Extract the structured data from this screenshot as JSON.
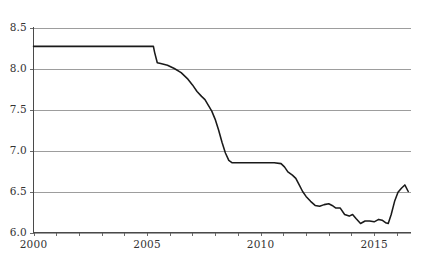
{
  "chart_data": {
    "type": "line",
    "title": "",
    "subtitle": "",
    "xlabel": "",
    "ylabel": "",
    "xlim": [
      2000,
      2016.6
    ],
    "ylim": [
      6.0,
      8.5
    ],
    "grid": true,
    "legend": null,
    "legend_position": "none",
    "line_color": "#1a1a1a",
    "grid_color": "#8c8c8c",
    "axis_color": "#4a4a4a",
    "background_color": "#ffffff",
    "y_ticks": [
      6.0,
      6.5,
      7.0,
      7.5,
      8.0,
      8.5
    ],
    "y_tick_labels": [
      "6.0",
      "6.5",
      "7.0",
      "7.5",
      "8.0",
      "8.5"
    ],
    "x_ticks": [
      2000,
      2001,
      2002,
      2003,
      2004,
      2005,
      2006,
      2007,
      2008,
      2009,
      2010,
      2011,
      2012,
      2013,
      2014,
      2015,
      2016
    ],
    "x_tick_labels_shown": [
      "2000",
      "2005",
      "2010",
      "2015"
    ],
    "x_labeled_ticks": [
      2000,
      2005,
      2010,
      2015
    ],
    "series": [
      {
        "name": "series-1",
        "x": [
          2000.0,
          2000.5,
          2001.0,
          2001.5,
          2002.0,
          2002.5,
          2003.0,
          2003.5,
          2004.0,
          2004.5,
          2005.0,
          2005.28,
          2005.33,
          2005.45,
          2005.6,
          2005.9,
          2006.2,
          2006.5,
          2006.8,
          2007.0,
          2007.2,
          2007.4,
          2007.55,
          2007.7,
          2007.85,
          2008.0,
          2008.15,
          2008.3,
          2008.45,
          2008.6,
          2008.75,
          2009.0,
          2009.4,
          2009.8,
          2010.2,
          2010.6,
          2010.9,
          2011.05,
          2011.2,
          2011.4,
          2011.55,
          2011.7,
          2011.85,
          2012.0,
          2012.2,
          2012.4,
          2012.6,
          2012.8,
          2013.0,
          2013.15,
          2013.3,
          2013.5,
          2013.7,
          2013.9,
          2014.05,
          2014.2,
          2014.4,
          2014.6,
          2014.8,
          2015.0,
          2015.2,
          2015.35,
          2015.5,
          2015.62,
          2015.75,
          2015.9,
          2016.05,
          2016.2,
          2016.35,
          2016.5
        ],
        "y": [
          8.27,
          8.27,
          8.27,
          8.27,
          8.27,
          8.27,
          8.27,
          8.27,
          8.27,
          8.27,
          8.27,
          8.27,
          8.2,
          8.07,
          8.06,
          8.04,
          8.0,
          7.95,
          7.87,
          7.8,
          7.72,
          7.66,
          7.62,
          7.55,
          7.48,
          7.38,
          7.25,
          7.1,
          6.97,
          6.88,
          6.85,
          6.85,
          6.85,
          6.85,
          6.85,
          6.85,
          6.84,
          6.8,
          6.74,
          6.7,
          6.66,
          6.58,
          6.5,
          6.44,
          6.38,
          6.33,
          6.32,
          6.34,
          6.35,
          6.33,
          6.3,
          6.3,
          6.22,
          6.2,
          6.22,
          6.17,
          6.11,
          6.14,
          6.14,
          6.13,
          6.16,
          6.15,
          6.12,
          6.11,
          6.22,
          6.38,
          6.49,
          6.54,
          6.58,
          6.5
        ]
      }
    ]
  }
}
